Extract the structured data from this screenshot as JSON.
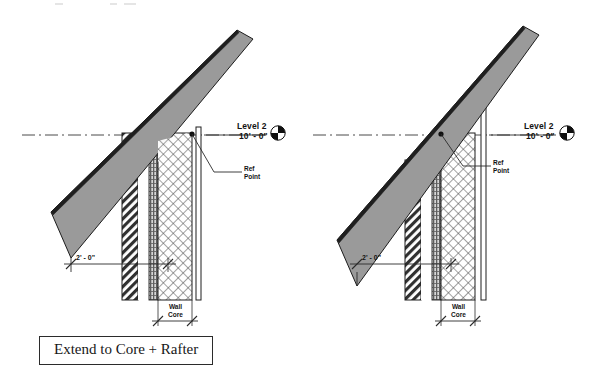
{
  "page": {
    "background_color": "#ffffff",
    "width": 590,
    "height": 389
  },
  "palette": {
    "roof_fill": "#9a9a9a",
    "roof_edge": "#1c1c1c",
    "rafter_hatch": "#3a3a3a",
    "stud_band": "#707070",
    "core_hatch": "#555555",
    "line": "#2b2b2b",
    "text": "#131313"
  },
  "diagrams": [
    {
      "id": "extend-to-core-rafter",
      "caption": "Extend to Core + Rafter",
      "level": {
        "name": "Level 2",
        "elevation": "10' - 0\""
      },
      "annotations": {
        "ref_point_line1": "Ref",
        "ref_point_line2": "Point",
        "offset_dimension": "2' - 0\"",
        "core_label_line1": "Wall",
        "core_label_line2": "Core"
      },
      "ref_point_attachment": "core-right-face"
    },
    {
      "id": "extend-to-core-truss",
      "caption": "Extend to Core + Truss",
      "level": {
        "name": "Level 2",
        "elevation": "10' - 0\""
      },
      "annotations": {
        "ref_point_line1": "Ref",
        "ref_point_line2": "Point",
        "offset_dimension": "2' - 0\"",
        "core_label_line1": "Wall",
        "core_label_line2": "Core"
      },
      "ref_point_attachment": "core-left-face"
    }
  ]
}
